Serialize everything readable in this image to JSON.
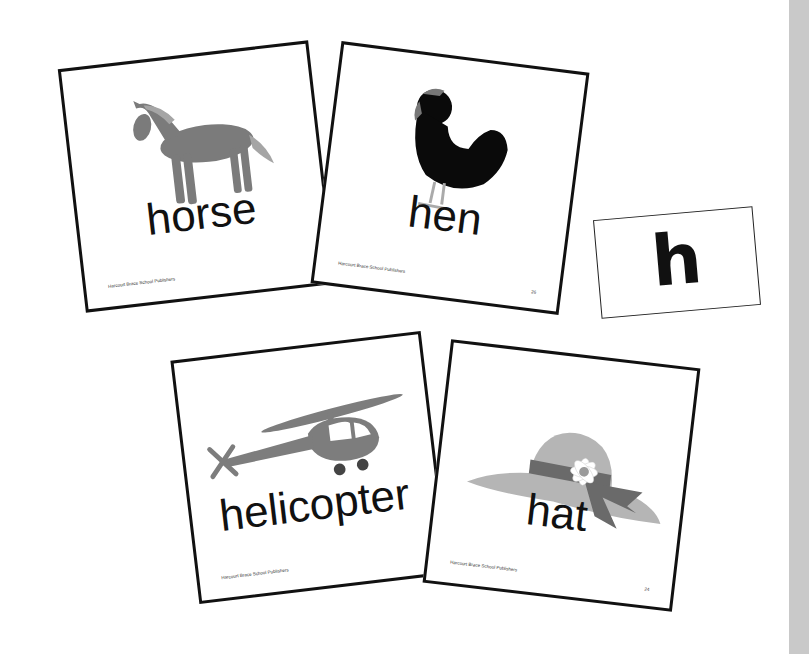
{
  "cards": {
    "horse": {
      "word": "horse",
      "publisher": "Harcourt Brace School Publishers",
      "picture": "horse-icon"
    },
    "hen": {
      "word": "hen",
      "publisher": "Harcourt Brace School Publishers",
      "page": "26",
      "picture": "hen-icon"
    },
    "helicopter": {
      "word": "helicopter",
      "publisher": "Harcourt Brace School Publishers",
      "picture": "helicopter-icon"
    },
    "hat": {
      "word": "hat",
      "publisher": "Harcourt Brace School Publishers",
      "page": "24",
      "picture": "hat-icon"
    }
  },
  "letter_card": {
    "letter": "h"
  },
  "colors": {
    "card_border": "#111111",
    "picture_gray": "#7a7a7a",
    "light_gray": "#b5b5b5",
    "side_strip": "#c9c9c9"
  }
}
